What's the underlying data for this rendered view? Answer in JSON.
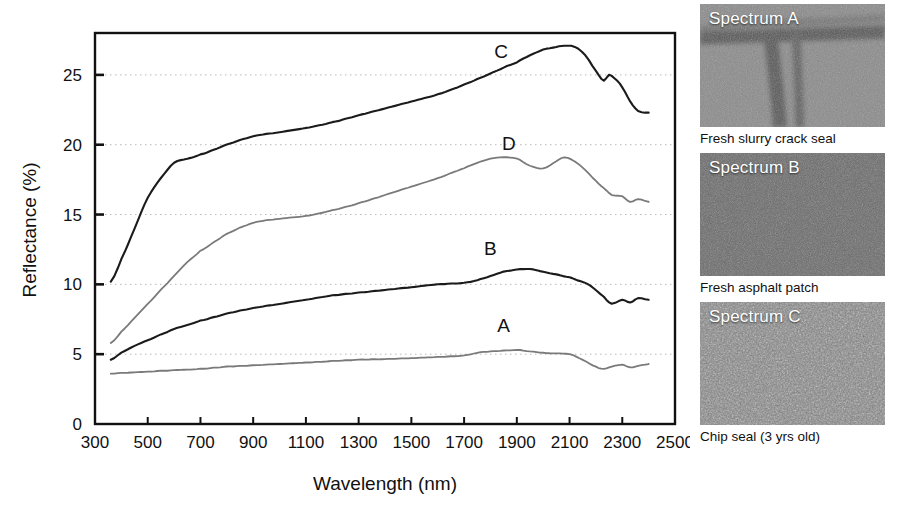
{
  "chart_data": {
    "type": "line",
    "title": "",
    "xlabel": "Wavelength (nm)",
    "ylabel": "Reflectance (%)",
    "xlim": [
      300,
      2500
    ],
    "ylim": [
      0,
      28
    ],
    "xticks": [
      300,
      500,
      700,
      900,
      1100,
      1300,
      1500,
      1700,
      1900,
      2100,
      2300,
      2500
    ],
    "yticks": [
      0,
      5,
      10,
      15,
      20,
      25
    ],
    "grid": "horizontal-dotted",
    "legend": "inline-labels",
    "series": [
      {
        "name": "A",
        "label": "A",
        "color": "#7a7a7a",
        "label_x": 1850,
        "label_y": 6.6,
        "x": [
          360,
          400,
          450,
          500,
          550,
          600,
          650,
          700,
          800,
          900,
          1000,
          1100,
          1200,
          1300,
          1400,
          1500,
          1600,
          1700,
          1750,
          1800,
          1850,
          1900,
          1950,
          2000,
          2050,
          2100,
          2150,
          2200,
          2230,
          2260,
          2300,
          2330,
          2360,
          2400
        ],
        "y": [
          3.6,
          3.65,
          3.7,
          3.75,
          3.8,
          3.85,
          3.9,
          3.95,
          4.1,
          4.2,
          4.3,
          4.4,
          4.5,
          4.6,
          4.65,
          4.72,
          4.8,
          4.9,
          5.1,
          5.2,
          5.25,
          5.3,
          5.2,
          5.1,
          5.05,
          5.0,
          4.6,
          4.1,
          3.95,
          4.1,
          4.25,
          4.05,
          4.15,
          4.3
        ]
      },
      {
        "name": "B",
        "label": "B",
        "color": "#1b1b1b",
        "label_x": 1800,
        "label_y": 12.1,
        "x": [
          360,
          400,
          450,
          500,
          550,
          600,
          650,
          700,
          800,
          900,
          1000,
          1100,
          1200,
          1300,
          1400,
          1500,
          1600,
          1700,
          1750,
          1800,
          1850,
          1900,
          1950,
          2000,
          2050,
          2100,
          2130,
          2180,
          2230,
          2260,
          2300,
          2330,
          2360,
          2400
        ],
        "y": [
          4.6,
          5.1,
          5.6,
          6.0,
          6.4,
          6.8,
          7.1,
          7.4,
          7.9,
          8.3,
          8.6,
          8.9,
          9.2,
          9.4,
          9.6,
          9.8,
          10.0,
          10.1,
          10.3,
          10.6,
          10.9,
          11.05,
          11.1,
          10.9,
          10.7,
          10.5,
          10.3,
          9.9,
          9.1,
          8.6,
          8.9,
          8.7,
          9.0,
          8.9
        ]
      },
      {
        "name": "C",
        "label": "C",
        "color": "#1b1b1b",
        "label_x": 1840,
        "label_y": 26.2,
        "x": [
          360,
          400,
          450,
          500,
          550,
          600,
          650,
          700,
          800,
          900,
          1000,
          1100,
          1200,
          1300,
          1400,
          1500,
          1600,
          1700,
          1800,
          1900,
          1950,
          2000,
          2050,
          2080,
          2120,
          2160,
          2200,
          2230,
          2250,
          2280,
          2300,
          2330,
          2360,
          2400
        ],
        "y": [
          10.2,
          11.8,
          14.0,
          16.2,
          17.6,
          18.7,
          19.0,
          19.3,
          20.0,
          20.6,
          20.9,
          21.2,
          21.6,
          22.1,
          22.6,
          23.1,
          23.6,
          24.3,
          25.1,
          25.9,
          26.4,
          26.8,
          27.0,
          27.1,
          27.0,
          26.4,
          25.3,
          24.6,
          25.0,
          24.6,
          24.1,
          23.1,
          22.4,
          22.3
        ]
      },
      {
        "name": "D",
        "label": "D",
        "color": "#7a7a7a",
        "label_x": 1870,
        "label_y": 19.6,
        "x": [
          360,
          400,
          450,
          500,
          550,
          600,
          650,
          700,
          800,
          900,
          1000,
          1100,
          1200,
          1300,
          1400,
          1500,
          1600,
          1700,
          1750,
          1800,
          1850,
          1900,
          1950,
          2000,
          2050,
          2080,
          2120,
          2160,
          2200,
          2230,
          2260,
          2300,
          2330,
          2360,
          2400
        ],
        "y": [
          5.8,
          6.6,
          7.6,
          8.6,
          9.6,
          10.6,
          11.6,
          12.4,
          13.6,
          14.4,
          14.7,
          14.9,
          15.3,
          15.8,
          16.4,
          17.0,
          17.6,
          18.3,
          18.7,
          19.0,
          19.1,
          19.0,
          18.5,
          18.3,
          18.8,
          19.1,
          18.8,
          18.2,
          17.4,
          16.9,
          16.4,
          16.3,
          15.9,
          16.1,
          15.9
        ]
      }
    ]
  },
  "photos": [
    {
      "tag": "Spectrum A",
      "caption": "Fresh slurry crack seal",
      "base_color": "#8a8a8a",
      "has_crack": true
    },
    {
      "tag": "Spectrum B",
      "caption": "Fresh asphalt patch",
      "base_color": "#6e6e6e",
      "has_crack": false
    },
    {
      "tag": "Spectrum C",
      "caption": "Chip seal (3 yrs old)",
      "base_color": "#7d7d7d",
      "has_crack": false
    }
  ],
  "colors": {
    "axis": "#111111",
    "grid": "#b9b9b9",
    "dark_curve": "#1b1b1b",
    "gray_curve": "#7a7a7a",
    "background": "#ffffff"
  }
}
